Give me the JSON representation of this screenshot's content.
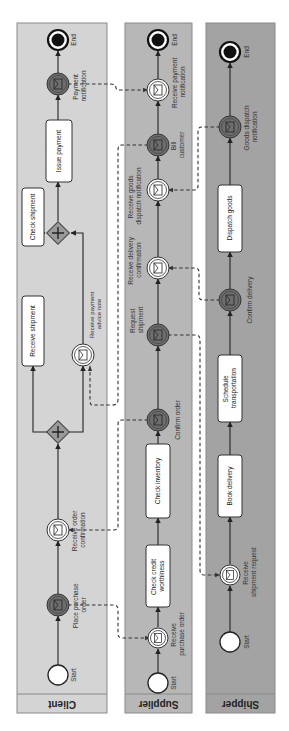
{
  "diagram": {
    "type": "BPMN collaboration",
    "orientation": "rotated 90deg counter-clockwise (flow bottom-to-top)",
    "colors": {
      "client_lane": "#d4d4d4",
      "supplier_lane": "#b7b7b7",
      "shipper_lane": "#a3a3a3",
      "lane_border": "#8a8a8a",
      "throw_event": "#6e6e6e",
      "gateway": "#9a9a9a",
      "task_fill": "#ffffff",
      "line": "#222222"
    }
  },
  "lanes": {
    "client": {
      "label": "Client",
      "start": "Start",
      "end": "End",
      "place_order": "Place purchase order",
      "place_order_l1": "Place purchase",
      "place_order_l2": "order",
      "receive_confirmation_l1": "Receive order",
      "receive_confirmation_l2": "confirmation",
      "receive_shipment": "Receive shipment",
      "check_shipment": "Check shipment",
      "receive_advice_l1": "Receive payment",
      "receive_advice_l2": "advice note",
      "issue_payment": "Issue payment",
      "payment_notification_l1": "Payment",
      "payment_notification_l2": "notification"
    },
    "supplier": {
      "label": "Supplier",
      "start": "Start",
      "end": "End",
      "receive_po_l1": "Receive",
      "receive_po_l2": "purchase order",
      "check_credit_l1": "Check credit",
      "check_credit_l2": "worthiness",
      "check_inventory": "Check inventory",
      "confirm_order": "Confirm order",
      "request_shipment_l1": "Request",
      "request_shipment_l2": "shipment",
      "receive_delivery_l1": "Receive delivery",
      "receive_delivery_l2": "confirmation",
      "receive_goods_l1": "Receive goods",
      "receive_goods_l2": "dispatch notification",
      "bill_customer_l1": "Bill",
      "bill_customer_l2": "customer",
      "receive_payment_l1": "Receive payment",
      "receive_payment_l2": "notification"
    },
    "shipper": {
      "label": "Shipper",
      "start": "Start",
      "end": "End",
      "receive_request_l1": "Receive",
      "receive_request_l2": "shipment request",
      "book_delivery": "Book delivery",
      "schedule_l1": "Schedule",
      "schedule_l2": "transportation",
      "confirm_delivery": "Confirm delivery",
      "dispatch_goods": "Dispatch goods",
      "goods_dispatch_l1": "Goods dispatch",
      "goods_dispatch_l2": "notification"
    }
  }
}
